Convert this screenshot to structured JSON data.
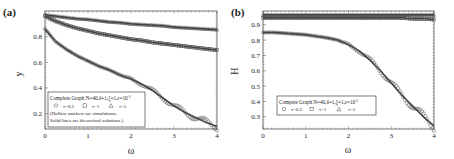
{
  "chart_data": [
    {
      "panel_label": "(a)",
      "type": "scatter",
      "title": "",
      "xlabel": "ω",
      "ylabel": "y",
      "xlim": [
        0,
        4
      ],
      "ylim": [
        0.08,
        1.0
      ],
      "xticks": [
        "0",
        "1",
        "2",
        "3",
        "4"
      ],
      "yticks": [
        "0.2",
        "0.4",
        "0.6",
        "0.8"
      ],
      "grid": false,
      "legend_position": "lower left",
      "legend": {
        "title": "Complete Graph N=40,δ=1,ξ=1,ε=10",
        "title_sup": "-3",
        "entries": [
          {
            "marker": "circle",
            "label": "τ=0.2"
          },
          {
            "marker": "square",
            "label": "τ=1"
          },
          {
            "marker": "triangle",
            "label": "τ=5"
          }
        ],
        "notes": [
          "(Hollow markers are simulations.",
          "Solid lines are theoretical solutions.)"
        ]
      },
      "x": [
        0,
        0.25,
        0.5,
        0.75,
        1.0,
        1.25,
        1.5,
        1.75,
        2.0,
        2.25,
        2.5,
        2.75,
        3.0,
        3.25,
        3.5,
        3.75,
        4.0
      ],
      "series": [
        {
          "name": "τ=5",
          "marker": "triangle",
          "values": [
            0.97,
            0.96,
            0.95,
            0.94,
            0.935,
            0.925,
            0.915,
            0.91,
            0.9,
            0.895,
            0.89,
            0.885,
            0.875,
            0.87,
            0.865,
            0.86,
            0.855
          ]
        },
        {
          "name": "τ=1",
          "marker": "square",
          "values": [
            0.96,
            0.92,
            0.89,
            0.865,
            0.845,
            0.825,
            0.81,
            0.795,
            0.78,
            0.77,
            0.755,
            0.745,
            0.735,
            0.725,
            0.715,
            0.705,
            0.695
          ]
        },
        {
          "name": "τ=0.2",
          "marker": "circle",
          "values": [
            0.86,
            0.76,
            0.7,
            0.65,
            0.61,
            0.57,
            0.54,
            0.5,
            0.47,
            0.43,
            0.38,
            0.32,
            0.26,
            0.21,
            0.17,
            0.13,
            0.1
          ]
        }
      ]
    },
    {
      "panel_label": "(b)",
      "type": "scatter",
      "title": "",
      "xlabel": "ω",
      "ylabel": "H",
      "xlim": [
        0,
        4
      ],
      "ylim": [
        0.22,
        0.99
      ],
      "xticks": [
        "0",
        "1",
        "2",
        "3",
        "4"
      ],
      "yticks": [
        "0.3",
        "0.4",
        "0.5",
        "0.6",
        "0.7",
        "0.8",
        "0.9"
      ],
      "grid": false,
      "legend_position": "lower left",
      "legend": {
        "title": "Compete Graph N=40,δ=1,ξ=1,ε=10",
        "title_sup": "-3",
        "entries": [
          {
            "marker": "circle",
            "label": "τ=0.2"
          },
          {
            "marker": "square",
            "label": "τ=1"
          },
          {
            "marker": "triangle",
            "label": "τ=5"
          }
        ]
      },
      "x": [
        0,
        0.25,
        0.5,
        0.75,
        1.0,
        1.25,
        1.5,
        1.75,
        2.0,
        2.25,
        2.5,
        2.75,
        3.0,
        3.25,
        3.5,
        3.75,
        4.0
      ],
      "series": [
        {
          "name": "τ=5",
          "marker": "triangle",
          "values": [
            0.965,
            0.965,
            0.965,
            0.965,
            0.965,
            0.965,
            0.965,
            0.965,
            0.965,
            0.965,
            0.965,
            0.965,
            0.965,
            0.965,
            0.965,
            0.965,
            0.965
          ]
        },
        {
          "name": "τ=1",
          "marker": "square",
          "values": [
            0.945,
            0.945,
            0.945,
            0.945,
            0.945,
            0.945,
            0.945,
            0.945,
            0.945,
            0.945,
            0.945,
            0.945,
            0.945,
            0.945,
            0.94,
            0.94,
            0.935
          ]
        },
        {
          "name": "τ=0.2",
          "marker": "circle",
          "values": [
            0.85,
            0.85,
            0.845,
            0.84,
            0.835,
            0.825,
            0.815,
            0.8,
            0.77,
            0.73,
            0.67,
            0.6,
            0.52,
            0.44,
            0.37,
            0.3,
            0.24
          ]
        }
      ]
    }
  ],
  "panels": {
    "a": {
      "label": "(a)",
      "ylabel": "y",
      "xlabel": "ω",
      "legend_title": "Complete Graph N=40,δ=1,ξ=1,ε=10",
      "legend_sup": "-3",
      "legend_e1": "τ=0.2",
      "legend_e2": "τ=1",
      "legend_e3": "τ=5",
      "note1": "(Hollow markers are simulations.",
      "note2": "Solid lines are theoretical solutions.)",
      "xticks": [
        "0",
        "1",
        "2",
        "3",
        "4"
      ],
      "yticks": [
        "0.2",
        "0.4",
        "0.6",
        "0.8"
      ]
    },
    "b": {
      "label": "(b)",
      "ylabel": "H",
      "xlabel": "ω",
      "legend_title": "Compete Graph N=40,δ=1,ξ=1,ε=10",
      "legend_sup": "-3",
      "legend_e1": "τ=0.2",
      "legend_e2": "τ=1",
      "legend_e3": "τ=5",
      "xticks": [
        "0",
        "1",
        "2",
        "3",
        "4"
      ],
      "yticks": [
        "0.3",
        "0.4",
        "0.5",
        "0.6",
        "0.7",
        "0.8",
        "0.9"
      ]
    }
  }
}
